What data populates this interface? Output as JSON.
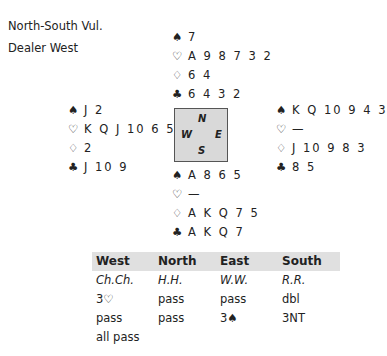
{
  "deal_info": {
    "vulnerability": "North-South Vul.",
    "dealer": "Dealer West"
  },
  "suits": {
    "spades": "♠",
    "hearts": "♡",
    "diamonds": "♢",
    "clubs": "♣"
  },
  "hands": {
    "north": {
      "spades": "7",
      "hearts": "A 9 8 7 3 2",
      "diamonds": "6 4",
      "clubs": "6 4 3 2"
    },
    "west": {
      "spades": "J 2",
      "hearts": "K Q J 10 6 5 4",
      "diamonds": "2",
      "clubs": "J 10 9"
    },
    "east": {
      "spades": "K Q 10 9 4 3",
      "hearts": "—",
      "diamonds": "J 10 9 8 3",
      "clubs": "8 5"
    },
    "south": {
      "spades": "A 8 6 5",
      "hearts": "—",
      "diamonds": "A K Q 7 5",
      "clubs": "A K Q 7"
    }
  },
  "compass": {
    "n": "N",
    "s": "S",
    "e": "E",
    "w": "W"
  },
  "auction": {
    "headers": [
      "West",
      "North",
      "East",
      "South"
    ],
    "players": [
      "Ch.Ch.",
      "H.H.",
      "W.W.",
      "R.R."
    ],
    "rounds": [
      [
        "3♡",
        "pass",
        "pass",
        "dbl"
      ],
      [
        "pass",
        "pass",
        "3♠",
        "3NT"
      ],
      [
        "all pass",
        "",
        "",
        ""
      ]
    ]
  }
}
